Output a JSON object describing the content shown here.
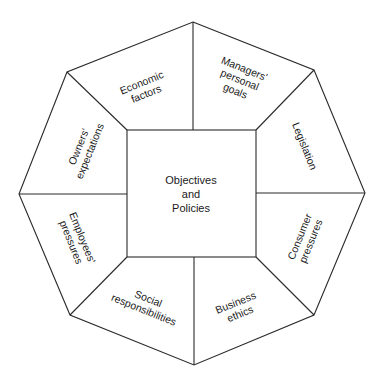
{
  "diagram": {
    "type": "octagon-influence-diagram",
    "center": {
      "lines": [
        "Objectives",
        "and",
        "Policies"
      ]
    },
    "segments": [
      {
        "id": "economic-factors",
        "lines": [
          "Economic",
          "factors"
        ],
        "position": "top-left"
      },
      {
        "id": "managers-personal-goals",
        "lines": [
          "Managers'",
          "personal",
          "goals"
        ],
        "position": "top-right"
      },
      {
        "id": "legislation",
        "lines": [
          "Legislation"
        ],
        "position": "right-upper"
      },
      {
        "id": "consumer-pressures",
        "lines": [
          "Consumer",
          "pressures"
        ],
        "position": "right-lower"
      },
      {
        "id": "business-ethics",
        "lines": [
          "Business",
          "ethics"
        ],
        "position": "bottom-right"
      },
      {
        "id": "social-responsibilities",
        "lines": [
          "Social",
          "responsibilities"
        ],
        "position": "bottom-left"
      },
      {
        "id": "employees-pressures",
        "lines": [
          "Employees'",
          "pressures"
        ],
        "position": "left-lower"
      },
      {
        "id": "owners-expectations",
        "lines": [
          "Owners'",
          "expectations"
        ],
        "position": "left-upper"
      }
    ],
    "colors": {
      "line": "#2a2a2a",
      "text": "#1a1a1a",
      "background": "#ffffff"
    }
  }
}
